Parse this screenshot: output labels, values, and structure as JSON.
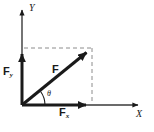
{
  "figure": {
    "kind": "free-body-vector-diagram",
    "background_color": "#ffffff",
    "stroke_color": "#1a1a1a",
    "dash_color": "#8c8c8c",
    "width": 154,
    "height": 132
  },
  "axes": {
    "y_label": "Y",
    "x_label": "X",
    "origin": {
      "x": 22,
      "y": 105
    },
    "y_top": 8,
    "x_right": 140
  },
  "vectors": [
    {
      "name": "resultant-force",
      "label": "F",
      "from": {
        "x": 22,
        "y": 105
      },
      "to": {
        "x": 92,
        "y": 48
      }
    },
    {
      "name": "force-y-component",
      "label": "F",
      "subscript": "y",
      "from": {
        "x": 22,
        "y": 105
      },
      "to": {
        "x": 22,
        "y": 48
      }
    },
    {
      "name": "force-x-component",
      "label": "F",
      "subscript": "x",
      "from": {
        "x": 22,
        "y": 105
      },
      "to": {
        "x": 92,
        "y": 105
      }
    }
  ],
  "angle": {
    "label": "θ",
    "name": "theta"
  },
  "guides": [
    {
      "name": "horizontal-projection",
      "from": {
        "x": 22,
        "y": 48
      },
      "to": {
        "x": 92,
        "y": 48
      }
    },
    {
      "name": "vertical-projection",
      "from": {
        "x": 92,
        "y": 48
      },
      "to": {
        "x": 92,
        "y": 105
      }
    }
  ]
}
